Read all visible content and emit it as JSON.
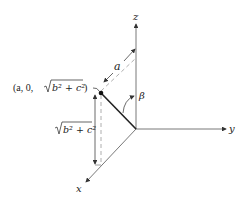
{
  "diagram": {
    "axes": {
      "x_label": "x",
      "y_label": "y",
      "z_label": "z"
    },
    "point_label": {
      "prefix": "(a, 0, ",
      "radicand": "b² + c²",
      "suffix": ")"
    },
    "length_label": "a",
    "angle_label": "β",
    "height_label": {
      "radicand": "b² + c²"
    },
    "colors": {
      "line": "#333333",
      "dashed": "#888888",
      "background": "#ffffff"
    }
  }
}
